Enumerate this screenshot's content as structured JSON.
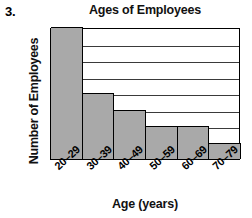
{
  "figure": {
    "problem_number": "3."
  },
  "chart_data": {
    "type": "bar",
    "title": "Ages of Employees",
    "xlabel": "Age (years)",
    "ylabel": "Number of Employees",
    "categories": [
      "20–29",
      "30–39",
      "40–49",
      "50–59",
      "60–69",
      "70–79"
    ],
    "values": [
      8,
      4,
      3,
      2,
      2,
      1
    ],
    "ylim": [
      0,
      8
    ],
    "ytick_labels": [
      "0",
      "2",
      "4",
      "6",
      "8"
    ],
    "ytick_values": [
      0,
      2,
      4,
      6,
      8
    ],
    "gridlines": [
      1,
      2,
      3,
      4,
      5,
      6,
      7
    ],
    "grid": true,
    "legend": null,
    "bar_fill_color": "#a9a9a9",
    "bar_edge_color": "#000000",
    "background_color": "#ffffff"
  }
}
